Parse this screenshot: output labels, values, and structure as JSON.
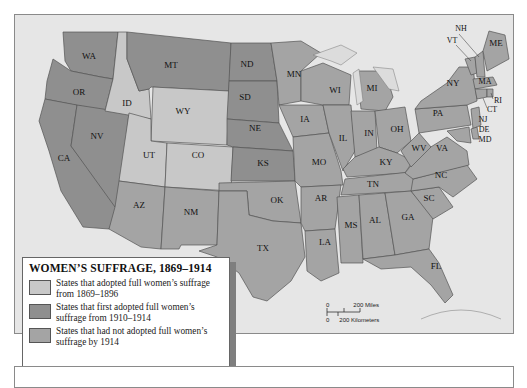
{
  "legend": {
    "title": "WOMEN’S SUFFRAGE, 1869–1914",
    "items": [
      {
        "label": "States that adopted full women’s suffrage from 1869–1896",
        "color": "#c8c8c8"
      },
      {
        "label": "States that first adopted full women’s suffrage from 1910–1914",
        "color": "#8f8f8f"
      },
      {
        "label": "States that had not adopted full women’s suffrage by 1914",
        "color": "#a4a4a4"
      }
    ]
  },
  "scale": {
    "miles_zero": "0",
    "miles_label": "200 Miles",
    "km_zero": "0",
    "km_label": "200 Kilometers"
  },
  "states": {
    "WA": "WA",
    "OR": "OR",
    "CA": "CA",
    "NV": "NV",
    "ID": "ID",
    "MT": "MT",
    "WY": "WY",
    "UT": "UT",
    "CO": "CO",
    "AZ": "AZ",
    "NM": "NM",
    "ND": "ND",
    "SD": "SD",
    "NE": "NE",
    "KS": "KS",
    "OK": "OK",
    "TX": "TX",
    "MN": "MN",
    "IA": "IA",
    "MO": "MO",
    "AR": "AR",
    "LA": "LA",
    "WI": "WI",
    "IL": "IL",
    "MI": "MI",
    "IN": "IN",
    "OH": "OH",
    "KY": "KY",
    "TN": "TN",
    "MS": "MS",
    "AL": "AL",
    "GA": "GA",
    "FL": "FL",
    "SC": "SC",
    "NC": "NC",
    "VA": "VA",
    "WV": "WV",
    "PA": "PA",
    "NY": "NY",
    "VT": "VT",
    "NH": "NH",
    "ME": "ME",
    "MA": "MA",
    "RI": "RI",
    "CT": "CT",
    "NJ": "NJ",
    "DE": "DE",
    "MD": "MD"
  }
}
